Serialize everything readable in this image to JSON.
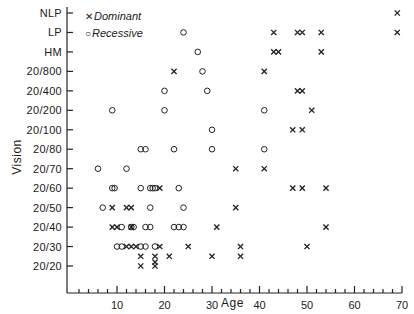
{
  "chart_data": {
    "type": "scatter",
    "title": "",
    "xlabel": "Age",
    "ylabel": "Vision",
    "xlim": [
      0,
      70
    ],
    "x_ticks": [
      10,
      20,
      30,
      40,
      50,
      60,
      70
    ],
    "x_minor_tick_step": 2,
    "y_categories": [
      "20/20",
      "20/30",
      "20/40",
      "20/50",
      "20/60",
      "20/70",
      "20/80",
      "20/100",
      "20/200",
      "20/400",
      "20/800",
      "HM",
      "LP",
      "NLP"
    ],
    "grid": false,
    "legend": {
      "position": "upper-left",
      "entries": [
        {
          "marker": "x",
          "label": "Dominant"
        },
        {
          "marker": "o",
          "label": "Recessive"
        }
      ]
    },
    "series": [
      {
        "name": "Dominant",
        "marker": "x",
        "points": [
          {
            "age": 69,
            "vision": "NLP"
          },
          {
            "age": 43,
            "vision": "LP"
          },
          {
            "age": 48,
            "vision": "LP"
          },
          {
            "age": 49,
            "vision": "LP"
          },
          {
            "age": 53,
            "vision": "LP"
          },
          {
            "age": 69,
            "vision": "LP"
          },
          {
            "age": 43,
            "vision": "HM"
          },
          {
            "age": 44,
            "vision": "HM"
          },
          {
            "age": 53,
            "vision": "HM"
          },
          {
            "age": 22,
            "vision": "20/800"
          },
          {
            "age": 41,
            "vision": "20/800"
          },
          {
            "age": 48,
            "vision": "20/400"
          },
          {
            "age": 49,
            "vision": "20/400"
          },
          {
            "age": 51,
            "vision": "20/200"
          },
          {
            "age": 47,
            "vision": "20/100"
          },
          {
            "age": 49,
            "vision": "20/100"
          },
          {
            "age": 35,
            "vision": "20/70"
          },
          {
            "age": 41,
            "vision": "20/70"
          },
          {
            "age": 19,
            "vision": "20/60"
          },
          {
            "age": 47,
            "vision": "20/60"
          },
          {
            "age": 49,
            "vision": "20/60"
          },
          {
            "age": 54,
            "vision": "20/60"
          },
          {
            "age": 9,
            "vision": "20/50"
          },
          {
            "age": 12,
            "vision": "20/50"
          },
          {
            "age": 13,
            "vision": "20/50"
          },
          {
            "age": 35,
            "vision": "20/50"
          },
          {
            "age": 9,
            "vision": "20/40"
          },
          {
            "age": 10,
            "vision": "20/40"
          },
          {
            "age": 13,
            "vision": "20/40"
          },
          {
            "age": 31,
            "vision": "20/40"
          },
          {
            "age": 54,
            "vision": "20/40"
          },
          {
            "age": 12,
            "vision": "20/30"
          },
          {
            "age": 13,
            "vision": "20/30"
          },
          {
            "age": 14,
            "vision": "20/30"
          },
          {
            "age": 19,
            "vision": "20/30"
          },
          {
            "age": 25,
            "vision": "20/30"
          },
          {
            "age": 36,
            "vision": "20/30"
          },
          {
            "age": 50,
            "vision": "20/30"
          },
          {
            "age": 15,
            "vision": "20/25"
          },
          {
            "age": 18,
            "vision": "20/25"
          },
          {
            "age": 21,
            "vision": "20/25"
          },
          {
            "age": 30,
            "vision": "20/25"
          },
          {
            "age": 36,
            "vision": "20/25"
          },
          {
            "age": 15,
            "vision": "20/20"
          },
          {
            "age": 18,
            "vision": "20/20"
          },
          {
            "age": 18,
            "vision": "20/22"
          }
        ]
      },
      {
        "name": "Recessive",
        "marker": "o",
        "points": [
          {
            "age": 24,
            "vision": "LP"
          },
          {
            "age": 27,
            "vision": "HM"
          },
          {
            "age": 28,
            "vision": "20/800"
          },
          {
            "age": 20,
            "vision": "20/400"
          },
          {
            "age": 29,
            "vision": "20/400"
          },
          {
            "age": 9,
            "vision": "20/200"
          },
          {
            "age": 20,
            "vision": "20/200"
          },
          {
            "age": 41,
            "vision": "20/200"
          },
          {
            "age": 30,
            "vision": "20/100"
          },
          {
            "age": 15,
            "vision": "20/80"
          },
          {
            "age": 16,
            "vision": "20/80"
          },
          {
            "age": 22,
            "vision": "20/80"
          },
          {
            "age": 30,
            "vision": "20/80"
          },
          {
            "age": 41,
            "vision": "20/80"
          },
          {
            "age": 6,
            "vision": "20/70"
          },
          {
            "age": 12,
            "vision": "20/70"
          },
          {
            "age": 9,
            "vision": "20/60"
          },
          {
            "age": 9.5,
            "vision": "20/60"
          },
          {
            "age": 15,
            "vision": "20/60"
          },
          {
            "age": 17,
            "vision": "20/60"
          },
          {
            "age": 17.5,
            "vision": "20/60"
          },
          {
            "age": 18,
            "vision": "20/60"
          },
          {
            "age": 23,
            "vision": "20/60"
          },
          {
            "age": 7,
            "vision": "20/50"
          },
          {
            "age": 17,
            "vision": "20/50"
          },
          {
            "age": 24,
            "vision": "20/50"
          },
          {
            "age": 11,
            "vision": "20/40"
          },
          {
            "age": 13,
            "vision": "20/40"
          },
          {
            "age": 13.5,
            "vision": "20/40"
          },
          {
            "age": 16,
            "vision": "20/40"
          },
          {
            "age": 17,
            "vision": "20/40"
          },
          {
            "age": 22,
            "vision": "20/40"
          },
          {
            "age": 23,
            "vision": "20/40"
          },
          {
            "age": 24,
            "vision": "20/40"
          },
          {
            "age": 10,
            "vision": "20/30"
          },
          {
            "age": 11,
            "vision": "20/30"
          },
          {
            "age": 15,
            "vision": "20/30"
          },
          {
            "age": 16,
            "vision": "20/30"
          },
          {
            "age": 18,
            "vision": "20/30"
          }
        ]
      }
    ]
  }
}
